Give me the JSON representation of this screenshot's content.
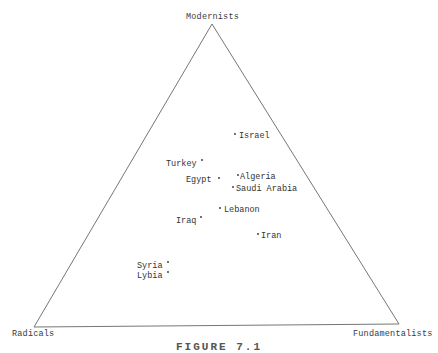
{
  "diagram": {
    "type": "ternary-triangle",
    "vertices": {
      "top": "Modernists",
      "bottom_left": "Radicals",
      "bottom_right": "Fundamentalists"
    },
    "countries": [
      {
        "name": "Israel",
        "dot_side": "left"
      },
      {
        "name": "Turkey",
        "dot_side": "right"
      },
      {
        "name": "Algeria",
        "dot_side": "left"
      },
      {
        "name": "Egypt",
        "dot_side": "right"
      },
      {
        "name": "Saudi Arabia",
        "dot_side": "left"
      },
      {
        "name": "Lebanon",
        "dot_side": "left"
      },
      {
        "name": "Iraq",
        "dot_side": "right"
      },
      {
        "name": "Iran",
        "dot_side": "left"
      },
      {
        "name": "Syria",
        "dot_side": "right"
      },
      {
        "name": "Lybia",
        "dot_side": "right"
      }
    ],
    "caption": "FIGURE 7.1",
    "line_color": "#555555"
  }
}
